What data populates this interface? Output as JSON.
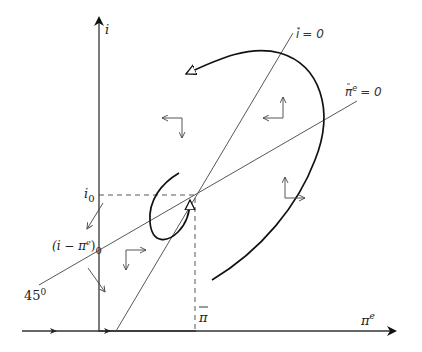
{
  "diagram": {
    "axes": {
      "y_label": "i",
      "x_label": "π",
      "x_label_sup": "e"
    },
    "loci": {
      "i_dot_zero": {
        "label_base": "i",
        "label_eq": "= 0"
      },
      "pi_dot_zero": {
        "label_base": "π",
        "label_sup": "e",
        "label_eq": "= 0"
      }
    },
    "markers": {
      "i0": {
        "base": "i",
        "sub": "0"
      },
      "i_minus_pi": {
        "text": "(i − π",
        "sup": "e",
        "tail": ")",
        "sub": "0"
      },
      "angle": {
        "base": "45",
        "sup": "0"
      },
      "pi_bar": {
        "text": "π"
      }
    },
    "colors": {
      "ink": "#222222",
      "thin": "#444444"
    }
  }
}
